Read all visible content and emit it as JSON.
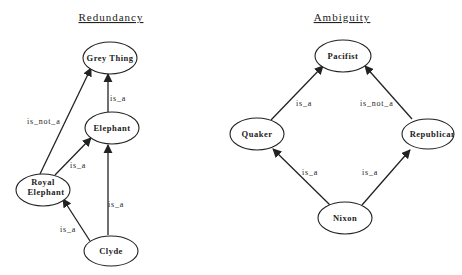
{
  "diagrams": {
    "redundancy": {
      "title": "Redundancy",
      "nodes": {
        "grey_thing": "Grey Thing",
        "elephant": "Elephant",
        "royal_elephant_line1": "Royal",
        "royal_elephant_line2": "Elephant",
        "clyde": "Clyde"
      },
      "edges": {
        "elephant_grey_thing": "is_a",
        "royal_elephant_grey_thing": "is_not_a",
        "royal_elephant_elephant": "is_a",
        "clyde_elephant": "is_a",
        "clyde_royal_elephant": "is_a"
      }
    },
    "ambiguity": {
      "title": "Ambiguity",
      "nodes": {
        "pacifist": "Pacifist",
        "quaker": "Quaker",
        "republican": "Republican",
        "nixon": "Nixon"
      },
      "edges": {
        "quaker_pacifist": "is_a",
        "republican_pacifist": "is_not_a",
        "nixon_quaker": "is_a",
        "nixon_republican": "is_a"
      }
    }
  },
  "colors": {
    "stroke": "#222222",
    "background": "#ffffff"
  }
}
